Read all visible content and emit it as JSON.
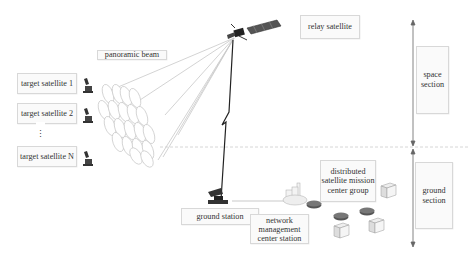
{
  "diagram": {
    "labels": {
      "panoramic_beam": "panoramic beam",
      "relay_satellite": "relay satellite",
      "target_satellite_1": "target satellite 1",
      "target_satellite_2": "target satellite 2",
      "target_satellite_ellipsis": "⋮",
      "target_satellite_n": "target satellite N",
      "space_section": "space section",
      "ground_section": "ground section",
      "ground_station": "ground station",
      "network_management": "network management center station",
      "mission_center_group": "distributed satellite mission center group"
    },
    "icons": {
      "relay_satellite": "satellite-icon",
      "target_satellites": "small-satellite-icon",
      "ground_station": "ground-antenna-icon",
      "network": "router-icon",
      "servers": "server-icon",
      "factory": "building-cluster-icon"
    },
    "colors": {
      "box_border": "#d8d8d8",
      "box_fill": "#fafafa",
      "beam_line": "#c8c8c8",
      "link": "#222222",
      "divider": "#cccccc"
    }
  }
}
